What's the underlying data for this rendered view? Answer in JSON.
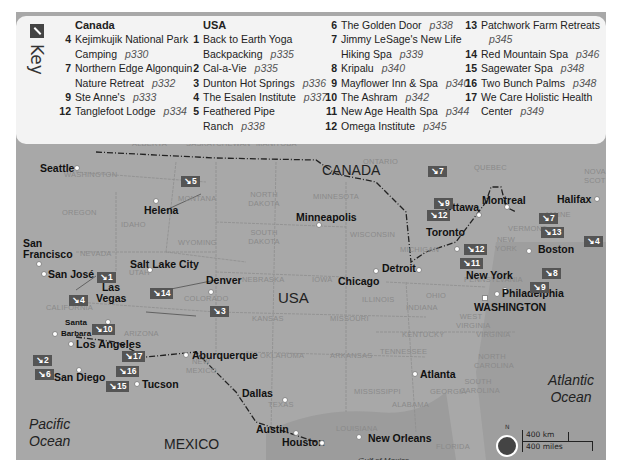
{
  "key": {
    "title": "Key",
    "canada": {
      "heading": "Canada",
      "items": [
        {
          "num": "4",
          "name": "Kejimkujik National Park",
          "cont": "Camping",
          "page": "p330"
        },
        {
          "num": "7",
          "name": "Northern Edge Algonquin",
          "cont": "Nature Retreat",
          "page": "p332"
        },
        {
          "num": "9",
          "name": "Ste Anne's",
          "page": "p333"
        },
        {
          "num": "12",
          "name": "Tanglefoot Lodge",
          "page": "p334"
        }
      ]
    },
    "usa": {
      "heading": "USA",
      "items": [
        {
          "num": "1",
          "name": "Back to Earth Yoga",
          "cont": "Backpacking",
          "page": "p335"
        },
        {
          "num": "2",
          "name": "Cal-a-Vie",
          "page": "p335"
        },
        {
          "num": "3",
          "name": "Dunton Hot Springs",
          "page": "p336"
        },
        {
          "num": "4",
          "name": "The Esalen Institute",
          "page": "p337"
        },
        {
          "num": "5",
          "name": "Feathered Pipe",
          "cont": "Ranch",
          "page": "p338"
        },
        {
          "num": "6",
          "name": "The Golden Door",
          "page": "p338"
        },
        {
          "num": "7",
          "name": "Jimmy LeSage's New Life",
          "cont": "Hiking Spa",
          "page": "p339"
        },
        {
          "num": "8",
          "name": "Kripalu",
          "page": "p340"
        },
        {
          "num": "9",
          "name": "Mayflower Inn & Spa",
          "page": "p340"
        },
        {
          "num": "10",
          "name": "The Ashram",
          "page": "p342"
        },
        {
          "num": "11",
          "name": "New Age Health Spa",
          "page": "p344"
        },
        {
          "num": "12",
          "name": "Omega Institute",
          "page": "p345"
        },
        {
          "num": "13",
          "name": "Patchwork Farm Retreats",
          "cont": "",
          "page": "p345"
        },
        {
          "num": "14",
          "name": "Red Mountain Spa",
          "page": "p346"
        },
        {
          "num": "15",
          "name": "Sagewater Spa",
          "page": "p348"
        },
        {
          "num": "16",
          "name": "Two Bunch Palms",
          "page": "p348"
        },
        {
          "num": "17",
          "name": "We Care Holistic Health",
          "cont": "Center",
          "page": "p349"
        }
      ]
    }
  },
  "countries": {
    "canada": "CANADA",
    "usa": "USA",
    "mexico": "MEXICO"
  },
  "oceans": {
    "pacific": "Pacific Ocean",
    "atlantic": "Atlantic Ocean",
    "gulf": "Gulf of Mexico"
  },
  "cities": {
    "seattle": "Seattle",
    "helena": "Helena",
    "minneapolis": "Minneapolis",
    "ottawa": "Ottawa",
    "montreal": "Montreal",
    "halifax": "Halifax",
    "toronto": "Toronto",
    "boston": "Boston",
    "detroit": "Detroit",
    "chicago": "Chicago",
    "newyork": "New York",
    "philadelphia": "Philadelphia",
    "washington": "WASHINGTON",
    "sanfrancisco": "San Francisco",
    "sanjose": "San José",
    "saltlake": "Salt Lake City",
    "denver": "Denver",
    "lasvegas": "Las Vegas",
    "santabarbara": "Santa Barbara",
    "losangeles": "Los Angeles",
    "sandiego": "San Diego",
    "tucson": "Tucson",
    "albuquerque": "Aburquerque",
    "dallas": "Dallas",
    "austin": "Austin",
    "houston": "Houston",
    "neworleans": "New Orleans",
    "atlanta": "Atlanta"
  },
  "states": {
    "alberta": "ALBERTA",
    "saskatchewan": "SASKATCHEWAN",
    "manitoba": "MANITOBA",
    "ontario": "ONTARIO",
    "quebec": "QUEBEC",
    "novascotia": "NOVA SCOTIA",
    "washington": "WASHINGTON",
    "oregon": "OREGON",
    "idaho": "IDAHO",
    "montana": "MONTANA",
    "wyoming": "WYOMING",
    "nevada": "NEVADA",
    "utah": "UTAH",
    "colorado": "COLORADO",
    "california": "CALIFORNIA",
    "arizona": "ARIZONA",
    "newmexico": "NEW MEXICO",
    "northdakota": "NORTH DAKOTA",
    "southdakota": "SOUTH DAKOTA",
    "nebraska": "NEBRASKA",
    "kansas": "KANSAS",
    "oklahoma": "OKLAHOMA",
    "texas": "TEXAS",
    "minnesota": "MINNESOTA",
    "iowa": "IOWA",
    "missouri": "MISSOURI",
    "arkansas": "ARKANSAS",
    "louisiana": "LOUISIANA",
    "wisconsin": "WISCONSIN",
    "illinois": "ILLINOIS",
    "michigan": "MICHIGAN",
    "indiana": "INDIANA",
    "ohio": "OHIO",
    "kentucky": "KENTUCKY",
    "tennessee": "TENNESSEE",
    "mississippi": "MISSISSIPPI",
    "alabama": "ALABAMA",
    "georgia": "GEORGIA",
    "florida": "FLORIDA",
    "southcarolina": "SOUTH CAROLINA",
    "northcarolina": "NORTH CAROLINA",
    "virginia": "VIRGINIA",
    "westvirginia": "WEST VIRGINIA",
    "pennsylvania": "PENNSYLVANIA",
    "newyork": "NEW YORK",
    "vermont": "VERMONT",
    "maine": "MAINE"
  },
  "badges": {
    "b5": "↘5",
    "b1": "↘1",
    "b4w": "↘4",
    "b14": "↘14",
    "b3": "↘3",
    "b10": "↘10",
    "b2": "↘2",
    "b6": "↘6",
    "b17": "↘17",
    "b16": "↘16",
    "b15": "↘15",
    "b7n": "↘7",
    "b9n": "↘9",
    "b12n": "↘12",
    "b12s": "↘12",
    "b11": "↘11",
    "b7e": "↘7",
    "b13": "↘13",
    "b4e": "↘4",
    "b8": "↘8",
    "b9s": "↘9"
  },
  "scale": {
    "north": "N",
    "km": "400 km",
    "miles": "400 miles"
  }
}
